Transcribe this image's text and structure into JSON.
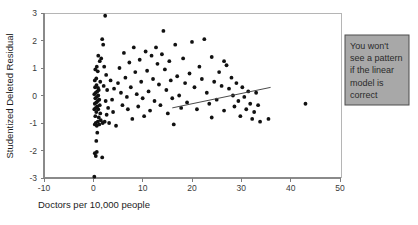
{
  "chart_data": {
    "type": "scatter",
    "title": "",
    "xlabel": "Doctors per 10,000 people",
    "ylabel": "Studentized Deleted Residual",
    "xlim": [
      -10,
      50
    ],
    "ylim": [
      -3,
      3
    ],
    "xticks": [
      -10,
      0,
      10,
      20,
      30,
      40,
      50
    ],
    "xtick_labels": [
      "-10",
      "0",
      "10",
      "20",
      "30",
      "40",
      "50"
    ],
    "yticks": [
      -3,
      -2,
      -1,
      0,
      1,
      2,
      3
    ],
    "ytick_labels": [
      "-3",
      "-2",
      "-1",
      "0",
      "1",
      "2",
      "3"
    ],
    "grid": false,
    "legend": null,
    "annotations": [
      {
        "name": "callout",
        "text": "You won't see a pattern if the linear model is correct",
        "lines": [
          "You won't",
          "see a pattern",
          "if the linear",
          "model is",
          "correct"
        ],
        "box_fill": "#a8a8a8",
        "box_stroke": "#4d4d4d",
        "pointer_from": [
          33.5,
          0.15
        ],
        "pointer_to": [
          16.0,
          -0.45
        ]
      }
    ],
    "marker_color": "#111111",
    "marker_size": 1.9,
    "points": [
      [
        0.2,
        -2.95
      ],
      [
        0.3,
        -2.1
      ],
      [
        0.5,
        -2.2
      ],
      [
        0.7,
        -2.05
      ],
      [
        0.6,
        -1.65
      ],
      [
        1.8,
        -2.25
      ],
      [
        0.8,
        -1.35
      ],
      [
        0.3,
        -1.05
      ],
      [
        0.5,
        -1.0
      ],
      [
        0.7,
        -1.1
      ],
      [
        0.9,
        -0.95
      ],
      [
        1.2,
        -1.05
      ],
      [
        1.5,
        -0.9
      ],
      [
        1.9,
        -1.0
      ],
      [
        2.3,
        -0.95
      ],
      [
        1.1,
        -0.8
      ],
      [
        0.4,
        -0.75
      ],
      [
        0.6,
        -0.6
      ],
      [
        1.4,
        -0.65
      ],
      [
        0.2,
        -0.5
      ],
      [
        0.5,
        -0.45
      ],
      [
        0.8,
        -0.4
      ],
      [
        1.0,
        -0.5
      ],
      [
        1.3,
        -0.35
      ],
      [
        0.3,
        -0.3
      ],
      [
        0.6,
        -0.25
      ],
      [
        0.9,
        -0.2
      ],
      [
        1.2,
        -0.15
      ],
      [
        0.4,
        -0.1
      ],
      [
        0.7,
        -0.05
      ],
      [
        1.0,
        0.0
      ],
      [
        0.2,
        0.05
      ],
      [
        0.5,
        0.1
      ],
      [
        0.8,
        0.15
      ],
      [
        1.1,
        0.2
      ],
      [
        0.35,
        0.3
      ],
      [
        0.65,
        0.38
      ],
      [
        0.95,
        0.28
      ],
      [
        0.3,
        0.55
      ],
      [
        0.6,
        0.62
      ],
      [
        1.4,
        0.5
      ],
      [
        0.4,
        0.95
      ],
      [
        0.7,
        1.05
      ],
      [
        0.9,
        0.88
      ],
      [
        1.3,
        1.25
      ],
      [
        1.0,
        1.45
      ],
      [
        1.6,
        1.35
      ],
      [
        1.8,
        2.05
      ],
      [
        2.0,
        1.85
      ],
      [
        2.4,
        2.9
      ],
      [
        2.2,
        1.05
      ],
      [
        2.6,
        0.75
      ],
      [
        2.1,
        0.35
      ],
      [
        2.8,
        0.2
      ],
      [
        2.5,
        -0.2
      ],
      [
        3.0,
        -0.45
      ],
      [
        2.7,
        -0.7
      ],
      [
        3.2,
        -1.0
      ],
      [
        3.5,
        0.55
      ],
      [
        3.8,
        -0.15
      ],
      [
        4.2,
        0.25
      ],
      [
        4.0,
        -0.6
      ],
      [
        4.6,
        -1.1
      ],
      [
        5.0,
        0.45
      ],
      [
        5.3,
        1.0
      ],
      [
        5.6,
        0.1
      ],
      [
        5.9,
        -0.35
      ],
      [
        6.2,
        1.55
      ],
      [
        6.5,
        0.65
      ],
      [
        6.8,
        -0.05
      ],
      [
        7.0,
        -0.5
      ],
      [
        7.3,
        1.2
      ],
      [
        7.6,
        0.3
      ],
      [
        7.9,
        -0.85
      ],
      [
        8.2,
        1.75
      ],
      [
        8.5,
        0.85
      ],
      [
        8.8,
        0.05
      ],
      [
        9.1,
        -0.4
      ],
      [
        9.4,
        1.3
      ],
      [
        9.7,
        0.5
      ],
      [
        10.0,
        -0.1
      ],
      [
        10.3,
        -0.75
      ],
      [
        10.6,
        1.6
      ],
      [
        10.9,
        0.9
      ],
      [
        11.2,
        0.15
      ],
      [
        11.5,
        -0.55
      ],
      [
        11.8,
        1.45
      ],
      [
        12.1,
        0.6
      ],
      [
        12.4,
        -0.2
      ],
      [
        12.7,
        1.75
      ],
      [
        13.0,
        1.15
      ],
      [
        13.3,
        0.4
      ],
      [
        13.6,
        -0.35
      ],
      [
        13.9,
        1.5
      ],
      [
        14.2,
        2.35
      ],
      [
        14.5,
        0.95
      ],
      [
        14.8,
        0.2
      ],
      [
        15.1,
        -0.65
      ],
      [
        15.4,
        1.25
      ],
      [
        15.7,
        0.55
      ],
      [
        16.0,
        -0.1
      ],
      [
        16.3,
        -1.05
      ],
      [
        16.6,
        1.85
      ],
      [
        17.0,
        0.7
      ],
      [
        17.4,
        0.0
      ],
      [
        17.8,
        -0.45
      ],
      [
        18.2,
        1.35
      ],
      [
        18.6,
        0.45
      ],
      [
        19.0,
        -0.25
      ],
      [
        19.5,
        0.8
      ],
      [
        20.0,
        1.95
      ],
      [
        20.5,
        0.3
      ],
      [
        21.0,
        -0.5
      ],
      [
        21.5,
        1.05
      ],
      [
        22.0,
        0.6
      ],
      [
        22.5,
        2.05
      ],
      [
        23.0,
        0.1
      ],
      [
        23.5,
        -0.3
      ],
      [
        24.0,
        1.4
      ],
      [
        24.5,
        0.5
      ],
      [
        25.0,
        -0.15
      ],
      [
        25.5,
        0.85
      ],
      [
        26.0,
        0.35
      ],
      [
        26.5,
        -0.55
      ],
      [
        27.0,
        1.1
      ],
      [
        27.5,
        0.25
      ],
      [
        28.0,
        0.65
      ],
      [
        28.3,
        0.0
      ],
      [
        28.6,
        -0.4
      ],
      [
        29.0,
        0.45
      ],
      [
        29.4,
        -0.2
      ],
      [
        29.8,
        -0.75
      ],
      [
        30.2,
        0.3
      ],
      [
        30.6,
        -0.05
      ],
      [
        31.0,
        -0.5
      ],
      [
        31.4,
        0.15
      ],
      [
        31.8,
        -0.3
      ],
      [
        32.2,
        -0.85
      ],
      [
        32.6,
        -0.6
      ],
      [
        33.0,
        0.1
      ],
      [
        33.4,
        -0.35
      ],
      [
        33.8,
        -0.95
      ],
      [
        26.5,
        1.25
      ],
      [
        24.0,
        -0.8
      ],
      [
        35.5,
        -0.85
      ],
      [
        43.0,
        -0.3
      ]
    ]
  }
}
